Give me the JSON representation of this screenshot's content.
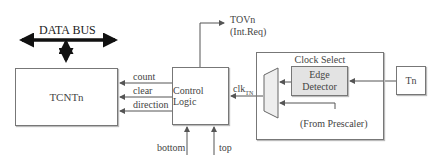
{
  "diagram": {
    "data_bus_label": "DATA BUS",
    "tcnt_label": "TCNTn",
    "control_logic_label": "Control Logic",
    "signals": {
      "count": "count",
      "clear": "clear",
      "direction": "direction"
    },
    "tov_label": "TOVn",
    "int_req_label": "(Int.Req)",
    "clk_label": "clk",
    "clk_subscript": "TN",
    "bottom_label": "bottom",
    "top_label": "top",
    "clock_select_label": "Clock Select",
    "edge_detector_line1": "Edge",
    "edge_detector_line2": "Detector",
    "prescaler_label": "(From Prescaler)",
    "tn_label": "Tn",
    "colors": {
      "line": "#555555",
      "box_border": "#777777",
      "edge_fill": "#e3e3e3",
      "bus": "#111111"
    }
  }
}
